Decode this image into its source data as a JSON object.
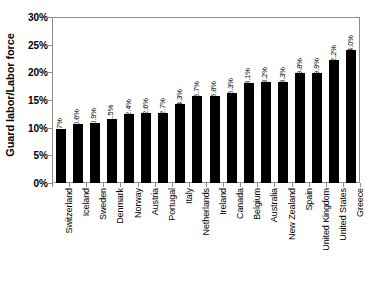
{
  "chart_data": {
    "type": "bar",
    "title": "",
    "subtitle": "",
    "xlabel": "",
    "ylabel": "Guard labor/Labor force",
    "ylim": [
      0,
      30
    ],
    "ytick_labels": [
      "0%",
      "5%",
      "10%",
      "15%",
      "20%",
      "25%",
      "30%"
    ],
    "ytick_values": [
      0,
      5,
      10,
      15,
      20,
      25,
      30
    ],
    "grid": false,
    "legend": false,
    "legend_position": "none",
    "bar_color": "#000000",
    "categories": [
      "Switzerland",
      "Iceland",
      "Sweden",
      "Denmark",
      "Norway",
      "Austria",
      "Portugal",
      "Italy",
      "Netherlands",
      "Ireland",
      "Canada",
      "Belgium",
      "Australia",
      "New Zealand",
      "Spain",
      "United Kingdom",
      "United States",
      "Greece"
    ],
    "values": [
      9.7,
      10.6,
      10.9,
      11.5,
      12.4,
      12.6,
      12.7,
      14.3,
      15.7,
      15.8,
      16.3,
      18.1,
      18.2,
      18.3,
      19.8,
      19.9,
      22.2,
      24.0
    ],
    "data_labels": [
      "9.7%",
      "10.6%",
      "10.9%",
      "11.5%",
      "12.4%",
      "12.6%",
      "12.7%",
      "14.3%",
      "15.7%",
      "15.8%",
      "16.3%",
      "18.1%",
      "18.2%",
      "18.3%",
      "19.8%",
      "19.9%",
      "22.2%",
      "24.0%"
    ]
  }
}
